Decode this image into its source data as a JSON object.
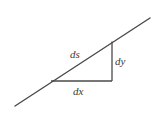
{
  "diagram": {
    "colors": {
      "line": "#4a4a4a",
      "text": "#3a3a3a",
      "background": "#ffffff"
    },
    "labels": {
      "hypotenuse": "ds",
      "vertical": "dy",
      "horizontal": "dx"
    }
  }
}
